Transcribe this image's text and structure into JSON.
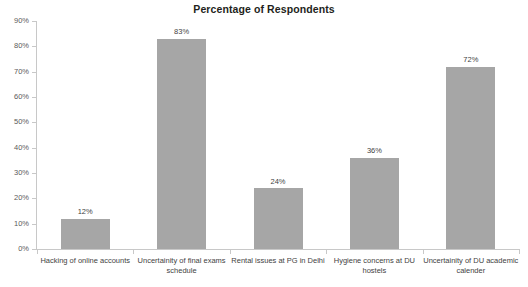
{
  "chart_data": {
    "type": "bar",
    "title": "Percentage of Respondents",
    "xlabel": "",
    "ylabel": "",
    "ylim": [
      0,
      90
    ],
    "grid": false,
    "legend": false,
    "orientation": "vertical",
    "series_color": "#a6a6a6",
    "categories": [
      "Hacking of online accounts",
      "Uncertainity of final exams schedule",
      "Rental issues at PG in Delhi",
      "Hygiene concerns at DU hostels",
      "Uncertainity of DU academic calender"
    ],
    "values": [
      12,
      83,
      24,
      36,
      72
    ],
    "value_labels": [
      "12%",
      "83%",
      "24%",
      "36%",
      "72%"
    ],
    "y_ticks": [
      0,
      10,
      20,
      30,
      40,
      50,
      60,
      70,
      80,
      90
    ],
    "y_tick_labels": [
      "0%",
      "10%",
      "20%",
      "30%",
      "40%",
      "50%",
      "60%",
      "70%",
      "80%",
      "90%"
    ]
  },
  "category_label_lines": [
    [
      "Hacking of online accounts"
    ],
    [
      "Uncertainity of final exams",
      "schedule"
    ],
    [
      "Rental issues at PG in Delhi"
    ],
    [
      "Hygiene concerns at DU",
      "hostels"
    ],
    [
      "Uncertainity of DU academic",
      "calender"
    ]
  ]
}
